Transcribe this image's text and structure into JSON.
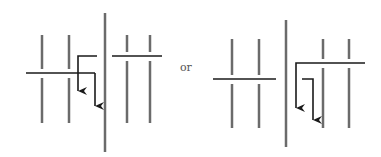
{
  "connector_label": "or",
  "colors": {
    "background": "#ffffff",
    "vertical_lines": "#6b6b6b",
    "horizontal_lines": "#1a1a1a",
    "label": "#555555"
  },
  "diagrams": [
    {
      "name": "left-arrangement",
      "description": "Two parallel lines left of a tall divider, two parallel lines right; one arrow path from a left horizontal crossing bar and one L-path from right side bar"
    },
    {
      "name": "right-arrangement",
      "description": "Two parallel lines left of a tall divider, two parallel lines right; a long L-arrow from right horizontal bar and a short L-arrow, both pointing down"
    }
  ]
}
